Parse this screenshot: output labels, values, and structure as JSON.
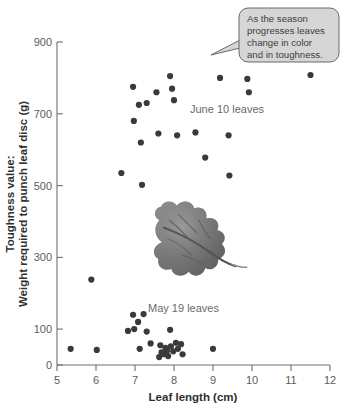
{
  "figure": {
    "background_color": "#ffffff",
    "point_color": "#3a3a3a",
    "axis_color": "#6e6e6e",
    "callout_fill": "#d6d6d6"
  },
  "axes": {
    "x_title": "Leaf length (cm)",
    "y_title_line1": "Toughness value:",
    "y_title_line2": "Weight required to punch leaf disc (g)",
    "x_ticks": [
      "5",
      "6",
      "7",
      "8",
      "9",
      "10",
      "11",
      "12"
    ],
    "y_ticks": [
      "0",
      "100",
      "300",
      "500",
      "700",
      "900"
    ]
  },
  "annotations": {
    "callout_line1": "As the season",
    "callout_line2": "progresses leaves",
    "callout_line3": "change in color",
    "callout_line4": "and in toughness.",
    "june_label": "June 10 leaves",
    "may_label": "May 19 leaves",
    "leaf_photo_alt": "oak-leaf-photograph"
  },
  "chart_data": {
    "type": "scatter",
    "title": "",
    "xlabel": "Leaf length (cm)",
    "ylabel": "Toughness value: Weight required to punch leaf disc (g)",
    "xlim": [
      5,
      12
    ],
    "ylim": [
      0,
      900
    ],
    "xticks": [
      5,
      6,
      7,
      8,
      9,
      10,
      11,
      12
    ],
    "yticks": [
      0,
      100,
      300,
      500,
      700,
      900
    ],
    "grid": false,
    "legend": "inline-text-labels",
    "series": [
      {
        "name": "June 10 leaves",
        "points": [
          [
            6.65,
            535
          ],
          [
            6.95,
            775
          ],
          [
            6.97,
            680
          ],
          [
            7.1,
            725
          ],
          [
            7.15,
            620
          ],
          [
            7.18,
            502
          ],
          [
            7.3,
            730
          ],
          [
            7.55,
            760
          ],
          [
            7.6,
            645
          ],
          [
            7.9,
            805
          ],
          [
            7.95,
            770
          ],
          [
            8.0,
            738
          ],
          [
            8.08,
            640
          ],
          [
            8.55,
            648
          ],
          [
            8.8,
            578
          ],
          [
            9.18,
            800
          ],
          [
            9.4,
            640
          ],
          [
            9.42,
            528
          ],
          [
            9.88,
            797
          ],
          [
            9.92,
            760
          ],
          [
            11.5,
            808
          ]
        ]
      },
      {
        "name": "May 19 leaves",
        "points": [
          [
            5.35,
            45
          ],
          [
            5.88,
            238
          ],
          [
            6.02,
            42
          ],
          [
            6.82,
            95
          ],
          [
            6.95,
            140
          ],
          [
            6.98,
            100
          ],
          [
            7.08,
            120
          ],
          [
            7.12,
            45
          ],
          [
            7.22,
            142
          ],
          [
            7.3,
            93
          ],
          [
            7.4,
            60
          ],
          [
            7.62,
            22
          ],
          [
            7.65,
            55
          ],
          [
            7.68,
            35
          ],
          [
            7.75,
            30
          ],
          [
            7.78,
            48
          ],
          [
            7.82,
            40
          ],
          [
            7.85,
            25
          ],
          [
            7.9,
            98
          ],
          [
            7.92,
            52
          ],
          [
            7.98,
            38
          ],
          [
            8.05,
            62
          ],
          [
            8.1,
            45
          ],
          [
            8.18,
            58
          ],
          [
            8.22,
            30
          ],
          [
            9.0,
            45
          ]
        ]
      }
    ]
  }
}
